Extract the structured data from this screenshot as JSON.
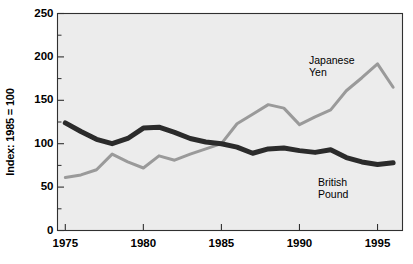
{
  "chart_data": {
    "type": "line",
    "title": "",
    "subtitle": "",
    "xlabel": "",
    "ylabel": "Index: 1985 = 100",
    "xlim": [
      1974.5,
      1996.6
    ],
    "ylim": [
      0,
      250
    ],
    "xticks": [
      1975,
      1980,
      1985,
      1990,
      1995
    ],
    "xtick_labels": [
      "1975",
      "1980",
      "1985",
      "1990",
      "1995"
    ],
    "yticks": [
      0,
      50,
      100,
      150,
      200,
      250
    ],
    "ytick_labels": [
      "0",
      "50",
      "100",
      "150",
      "200",
      "250"
    ],
    "yminorticks": [
      25,
      75,
      125,
      175,
      225
    ],
    "grid": false,
    "legend_position": "inline-annotation",
    "plot_background": "#ececec",
    "figure_background": "#ffffff",
    "axis_color": "#303030",
    "x": [
      1975,
      1976,
      1977,
      1978,
      1979,
      1980,
      1981,
      1982,
      1983,
      1984,
      1985,
      1986,
      1987,
      1988,
      1989,
      1990,
      1991,
      1992,
      1993,
      1994,
      1995,
      1996
    ],
    "series": [
      {
        "name": "Japanese Yen",
        "color": "#9a9a9a",
        "line_width": 3,
        "label_lines": [
          "Japanese",
          "Yen"
        ],
        "values": [
          61,
          64,
          70,
          88,
          79,
          72,
          86,
          81,
          88,
          94,
          100,
          123,
          134,
          145,
          141,
          122,
          131,
          139,
          161,
          176,
          192,
          165
        ]
      },
      {
        "name": "British Pound",
        "color": "#2b2b2b",
        "line_width": 5,
        "label_lines": [
          "British",
          "Pound"
        ],
        "values": [
          124,
          114,
          105,
          100,
          106,
          118,
          119,
          113,
          106,
          102,
          100,
          96,
          89,
          94,
          95,
          92,
          90,
          93,
          84,
          79,
          76,
          78
        ]
      }
    ]
  },
  "annotations": {
    "yen": {
      "line1": "Japanese",
      "line2": "Yen"
    },
    "pound": {
      "line1": "British",
      "line2": "Pound"
    }
  },
  "axes": {
    "y_title": "Index: 1985 = 100"
  }
}
